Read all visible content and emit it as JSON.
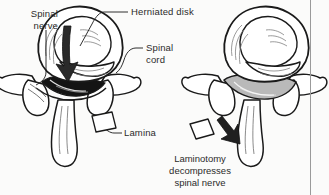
{
  "figure": {
    "background_color": "#fbfbfa",
    "ink_color": "#1a1a1a",
    "rule_color": "#9a9a9a"
  },
  "labels": {
    "spinal_nerve": "Spinal\nnerve",
    "herniated_disk": "Herniated disk",
    "spinal_cord": "Spinal\ncord",
    "lamina": "Lamina"
  },
  "caption": {
    "line1": "Laminotomy",
    "line2": "decompresses",
    "line3": "spinal nerve"
  },
  "panels": {
    "left": {
      "name": "herniated-disk-vertebra",
      "description": "Axial view of vertebra with herniated disk compressing the spinal canal"
    },
    "right": {
      "name": "laminotomy-vertebra",
      "description": "Axial view of vertebra after laminotomy with decompressed spinal canal"
    }
  },
  "annotations": {
    "herniation_arrow": "downward-arrow",
    "removed_bone_fragment": "lamina-fragment",
    "removal_arrow": "down-right-arrow"
  }
}
